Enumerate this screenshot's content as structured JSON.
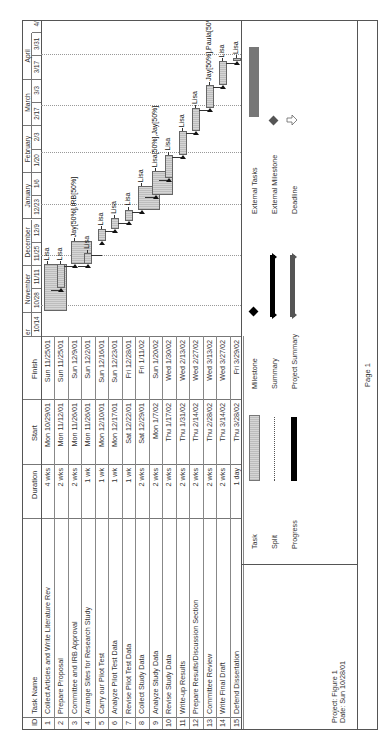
{
  "page": {
    "orientation": "rotated-90-ccw",
    "footer": "Page 1"
  },
  "table": {
    "headers": {
      "id": "ID",
      "task_name": "Task Name",
      "duration": "Duration",
      "start": "Start",
      "finish": "Finish"
    },
    "rows": [
      {
        "id": "1",
        "task_name": "Collect Articles and Write Literature Rev",
        "duration": "4 wks",
        "start": "Mon 10/29/01",
        "finish": "Sun 11/25/01"
      },
      {
        "id": "2",
        "task_name": "Prepare Proposal",
        "duration": "2 wks",
        "start": "Mon 11/12/01",
        "finish": "Sun 11/25/01"
      },
      {
        "id": "3",
        "task_name": "Committee and IRB Approval",
        "duration": "2 wks",
        "start": "Mon 11/26/01",
        "finish": "Sun 12/9/01"
      },
      {
        "id": "4",
        "task_name": "Arrange Sites for Research Study",
        "duration": "1 wk",
        "start": "Mon 11/26/01",
        "finish": "Sun 12/2/01"
      },
      {
        "id": "5",
        "task_name": "Carry our Pilot Test",
        "duration": "1 wk",
        "start": "Mon 12/10/01",
        "finish": "Sun 12/16/01"
      },
      {
        "id": "6",
        "task_name": "Analyze Pilot Test Data",
        "duration": "1 wk",
        "start": "Mon 12/17/01",
        "finish": "Sun 12/23/01"
      },
      {
        "id": "7",
        "task_name": "Revise Pilot Test Data",
        "duration": "1 wk",
        "start": "Sat 12/22/01",
        "finish": "Fri 12/28/01"
      },
      {
        "id": "8",
        "task_name": "Collect Study Data",
        "duration": "2 wks",
        "start": "Sat 12/29/01",
        "finish": "Fri 1/11/02"
      },
      {
        "id": "9",
        "task_name": "Analyze Study Data",
        "duration": "2 wks",
        "start": "Mon 1/7/02",
        "finish": "Sun 1/20/02"
      },
      {
        "id": "10",
        "task_name": "Revise Study Data",
        "duration": "2 wks",
        "start": "Thu 1/17/02",
        "finish": "Wed 1/30/02"
      },
      {
        "id": "11",
        "task_name": "Write-up Results",
        "duration": "2 wks",
        "start": "Thu 1/31/02",
        "finish": "Wed 2/13/02"
      },
      {
        "id": "12",
        "task_name": "Prepare Results/Discussion Section",
        "duration": "2 wks",
        "start": "Thu 2/14/02",
        "finish": "Wed 2/27/02"
      },
      {
        "id": "13",
        "task_name": "Committee Review",
        "duration": "2 wks",
        "start": "Thu 2/28/02",
        "finish": "Wed 3/13/02"
      },
      {
        "id": "14",
        "task_name": "Write Final Draft",
        "duration": "2 wks",
        "start": "Thu 3/14/02",
        "finish": "Wed 3/27/02"
      },
      {
        "id": "15",
        "task_name": "Defend Dissertation",
        "duration": "1 day",
        "start": "Thu 3/28/02",
        "finish": "Fri 3/29/02"
      }
    ]
  },
  "timescale": {
    "months": [
      {
        "label": "er",
        "start_tick": 0,
        "span": 1
      },
      {
        "label": "November",
        "start_tick": 1,
        "span": 2
      },
      {
        "label": "December",
        "start_tick": 3,
        "span": 2
      },
      {
        "label": "January",
        "start_tick": 5,
        "span": 2
      },
      {
        "label": "February",
        "start_tick": 7,
        "span": 2
      },
      {
        "label": "March",
        "start_tick": 9,
        "span": 2
      },
      {
        "label": "April",
        "start_tick": 11,
        "span": 2
      }
    ],
    "ticks": [
      "10/14",
      "10/28",
      "11/11",
      "11/25",
      "12/9",
      "12/23",
      "1/6",
      "1/20",
      "2/3",
      "2/17",
      "3/3",
      "3/17",
      "3/31",
      "4/14"
    ]
  },
  "chart_data": {
    "type": "gantt",
    "title": "",
    "xlabel": "",
    "ylabel": "",
    "time_axis": {
      "start": "10/14/01",
      "end": "4/21/02",
      "tick_interval_days": 14
    },
    "tasks": [
      {
        "id": 1,
        "name": "Collect Articles and Write Literature Rev",
        "start": "2001-10-29",
        "finish": "2001-11-25",
        "resources": "Lisa"
      },
      {
        "id": 2,
        "name": "Prepare Proposal",
        "start": "2001-11-12",
        "finish": "2001-11-25",
        "resources": "Lisa"
      },
      {
        "id": 3,
        "name": "Committee and IRB Approval",
        "start": "2001-11-26",
        "finish": "2001-12-09",
        "resources": "Jay[50%],IRB[50%]"
      },
      {
        "id": 4,
        "name": "Arrange Sites for Research Study",
        "start": "2001-11-26",
        "finish": "2001-12-02",
        "resources": "Lisa"
      },
      {
        "id": 5,
        "name": "Carry our Pilot Test",
        "start": "2001-12-10",
        "finish": "2001-12-16",
        "resources": "Lisa"
      },
      {
        "id": 6,
        "name": "Analyze Pilot Test Data",
        "start": "2001-12-17",
        "finish": "2001-12-23",
        "resources": "Lisa"
      },
      {
        "id": 7,
        "name": "Revise Pilot Test Data",
        "start": "2001-12-22",
        "finish": "2001-12-28",
        "resources": "Lisa"
      },
      {
        "id": 8,
        "name": "Collect Study Data",
        "start": "2001-12-29",
        "finish": "2002-01-11",
        "resources": "Lisa"
      },
      {
        "id": 9,
        "name": "Analyze Study Data",
        "start": "2002-01-07",
        "finish": "2002-01-20",
        "resources": "Lisa[50%],Jay[50%]"
      },
      {
        "id": 10,
        "name": "Revise Study Data",
        "start": "2002-01-17",
        "finish": "2002-01-30",
        "resources": "Lisa"
      },
      {
        "id": 11,
        "name": "Write-up Results",
        "start": "2002-01-31",
        "finish": "2002-02-13",
        "resources": "Lisa"
      },
      {
        "id": 12,
        "name": "Prepare Results/Discussion Section",
        "start": "2002-02-14",
        "finish": "2002-02-27",
        "resources": "Lisa"
      },
      {
        "id": 13,
        "name": "Committee Review",
        "start": "2002-02-28",
        "finish": "2002-03-13",
        "resources": "Jay[50%],Paula[50%]"
      },
      {
        "id": 14,
        "name": "Write Final Draft",
        "start": "2002-03-14",
        "finish": "2002-03-27",
        "resources": "Lisa"
      },
      {
        "id": 15,
        "name": "Defend Dissertation",
        "start": "2002-03-28",
        "finish": "2002-03-29",
        "resources": "Lisa"
      }
    ],
    "grid": "dotted vertical lines at month boundaries",
    "legend_position": "bottom"
  },
  "bars": [
    {
      "row": 0,
      "start_day": 15,
      "dur_days": 28,
      "label": "Lisa"
    },
    {
      "row": 1,
      "start_day": 29,
      "dur_days": 14,
      "label": "Lisa"
    },
    {
      "row": 2,
      "start_day": 43,
      "dur_days": 14,
      "label": "Jay[50%],IRB[50%]"
    },
    {
      "row": 3,
      "start_day": 43,
      "dur_days": 7,
      "label": "Lisa"
    },
    {
      "row": 4,
      "start_day": 57,
      "dur_days": 7,
      "label": "Lisa"
    },
    {
      "row": 5,
      "start_day": 64,
      "dur_days": 7,
      "label": "Lisa"
    },
    {
      "row": 6,
      "start_day": 69,
      "dur_days": 7,
      "label": "Lisa"
    },
    {
      "row": 7,
      "start_day": 76,
      "dur_days": 14,
      "label": "Lisa"
    },
    {
      "row": 8,
      "start_day": 85,
      "dur_days": 14,
      "label": "Lisa[50%],Jay[50%]"
    },
    {
      "row": 9,
      "start_day": 95,
      "dur_days": 14,
      "label": "Lisa"
    },
    {
      "row": 10,
      "start_day": 109,
      "dur_days": 14,
      "label": "Lisa"
    },
    {
      "row": 11,
      "start_day": 123,
      "dur_days": 14,
      "label": "Lisa"
    },
    {
      "row": 12,
      "start_day": 137,
      "dur_days": 14,
      "label": "Jay[50%],Paula[50%]"
    },
    {
      "row": 13,
      "start_day": 151,
      "dur_days": 14,
      "label": "Lisa"
    },
    {
      "row": 14,
      "start_day": 165,
      "dur_days": 2,
      "label": "Lisa"
    }
  ],
  "legend": {
    "project_line": "Project: Figure 1",
    "date_line": "Date: Sun 10/28/01",
    "col1": [
      "Task",
      "Split",
      "Progress"
    ],
    "col2": [
      "Milestone",
      "Summary",
      "Project Summary"
    ],
    "col3": [
      "External Tasks",
      "External Milestone",
      "Deadline"
    ]
  },
  "colors": {
    "task_bar": "#c8c8c8",
    "progress": "#000000",
    "summary": "#000000",
    "project_summary": "#555555",
    "external_tasks": "#777777",
    "external_milestone": "#555555"
  }
}
